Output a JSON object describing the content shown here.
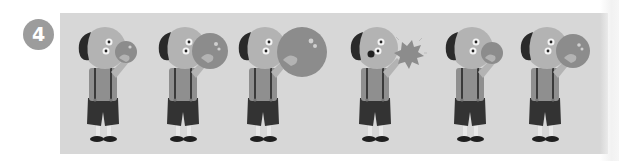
{
  "badge": {
    "number": "4",
    "color": "#9c9c9c",
    "text_color": "#ffffff"
  },
  "panel": {
    "background": "#d7d7d7"
  },
  "palette": {
    "skin": "#b3b3b3",
    "hair": "#2a2a2a",
    "shirt": "#8f8f8f",
    "shorts": "#333333",
    "suspenders": "#3a3a3a",
    "legs": "#e8e8e8",
    "shoes": "#1f1f1f",
    "bubble": "#8c8c8c",
    "eye_white": "#f4f4f4",
    "eye_pupil": "#222222"
  },
  "frames": [
    {
      "index": 1,
      "state": "small bubble",
      "x": 103,
      "bubble_r": 11
    },
    {
      "index": 2,
      "state": "medium bubble",
      "x": 183,
      "bubble_r": 18
    },
    {
      "index": 3,
      "state": "large bubble",
      "x": 263,
      "bubble_r": 25
    },
    {
      "index": 4,
      "state": "bubble popped",
      "x": 375,
      "bubble_r": 0
    },
    {
      "index": 5,
      "state": "small bubble",
      "x": 470,
      "bubble_r": 11
    },
    {
      "index": 6,
      "state": "medium bubble",
      "x": 545,
      "bubble_r": 17
    }
  ]
}
